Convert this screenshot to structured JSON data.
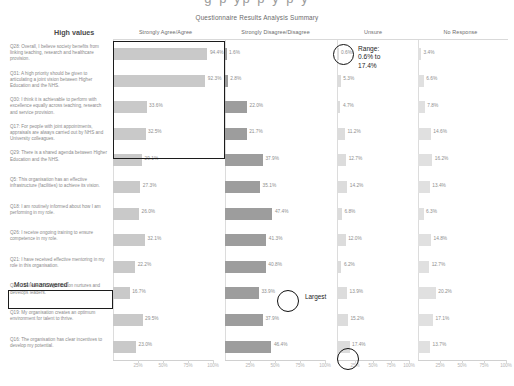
{
  "page": {
    "clipped_top_text": "g p yp p y p y"
  },
  "chart_data": {
    "type": "bar",
    "title": "Questionnaire Results Analysis Summary",
    "xlabel": "",
    "ylabel": "",
    "xlim": [
      0,
      100
    ],
    "ticks": [
      "25%",
      "50%",
      "75%",
      "100%"
    ],
    "grid": false,
    "legend": "none",
    "panel_headers": [
      "Strongly Agree/Agree",
      "Strongly Disagree/Disagree",
      "Unsure",
      "No Response"
    ],
    "side_label": "High values",
    "categories": [
      "Q28: Overall, I believe society benefits from linking teaching, research and healthcare provision.",
      "Q31: A high priority should be given to articulating a joint vision between Higher Education and the NHS.",
      "Q30: I think it is achievable to perform with excellence equally across teaching, research and service provision.",
      "Q17: For people with joint appointments, appraisals are always carried out by NHS and University colleagues.",
      "Q29: There is a shared agenda between Higher Education and the NHS.",
      "Q5: This organisation has an effective infrastructure (facilities) to achieve its vision.",
      "Q18: I am routinely informed about how I am performing in my role.",
      "Q26: I receive ongoing training to ensure competence in my role.",
      "Q21: I have received effective mentoring in my role in this organisation.",
      "Q24: I believe this organisation nurtures and develops leaders.",
      "Q19: My organisation creates an optimum environment for talent to thrive.",
      "Q16: The organisation has clear incentives to develop my potential."
    ],
    "series": [
      {
        "name": "Strongly Agree/Agree",
        "values": [
          94.4,
          92.3,
          33.6,
          32.5,
          29.1,
          27.3,
          26.0,
          32.1,
          22.2,
          16.7,
          29.5,
          23.0
        ],
        "labels": [
          "94.4%",
          "92.3%",
          "33.6%",
          "32.5%",
          "29.1%",
          "27.3%",
          "26.0%",
          "32.1%",
          "22.2%",
          "16.7%",
          "29.5%",
          "23.0%"
        ]
      },
      {
        "name": "Strongly Disagree/Disagree",
        "values": [
          1.6,
          2.8,
          22.0,
          21.7,
          37.9,
          35.1,
          47.4,
          41.3,
          40.8,
          33.9,
          37.9,
          46.4
        ],
        "labels": [
          "1.6%",
          "2.8%",
          "22.0%",
          "21.7%",
          "37.9%",
          "35.1%",
          "47.4%",
          "41.3%",
          "40.8%",
          "33.9%",
          "37.9%",
          "46.4%"
        ]
      },
      {
        "name": "Unsure",
        "values": [
          0.6,
          5.3,
          4.7,
          11.2,
          12.7,
          14.2,
          6.8,
          12.0,
          6.2,
          13.9,
          15.2,
          17.4
        ],
        "labels": [
          "0.6%",
          "5.3%",
          "4.7%",
          "11.2%",
          "12.7%",
          "14.2%",
          "6.8%",
          "12.0%",
          "6.2%",
          "13.9%",
          "15.2%",
          "17.4%"
        ]
      },
      {
        "name": "No Response",
        "values": [
          3.4,
          6.6,
          7.8,
          14.6,
          16.2,
          13.4,
          6.3,
          14.8,
          12.7,
          20.2,
          17.1,
          13.7
        ],
        "labels": [
          "3.4%",
          "6.6%",
          "7.8%",
          "14.6%",
          "16.2%",
          "13.4%",
          "6.3%",
          "14.8%",
          "12.7%",
          "20.2%",
          "17.1%",
          "13.7%"
        ]
      }
    ],
    "annotations": [
      {
        "id": "range",
        "text": "Range:\n0.6% to\n17.4%"
      },
      {
        "id": "largest",
        "text": "Largest"
      },
      {
        "id": "most-unanswered",
        "text": "Most 'unanswered'"
      }
    ],
    "colors": {
      "agree_bar": "#c9c9c9",
      "disagree_bar": "#9d9d9d",
      "unsure_bar": "#dcdcdc",
      "noresponse_bar": "#e0e0e0",
      "annotation": "#111111"
    }
  }
}
